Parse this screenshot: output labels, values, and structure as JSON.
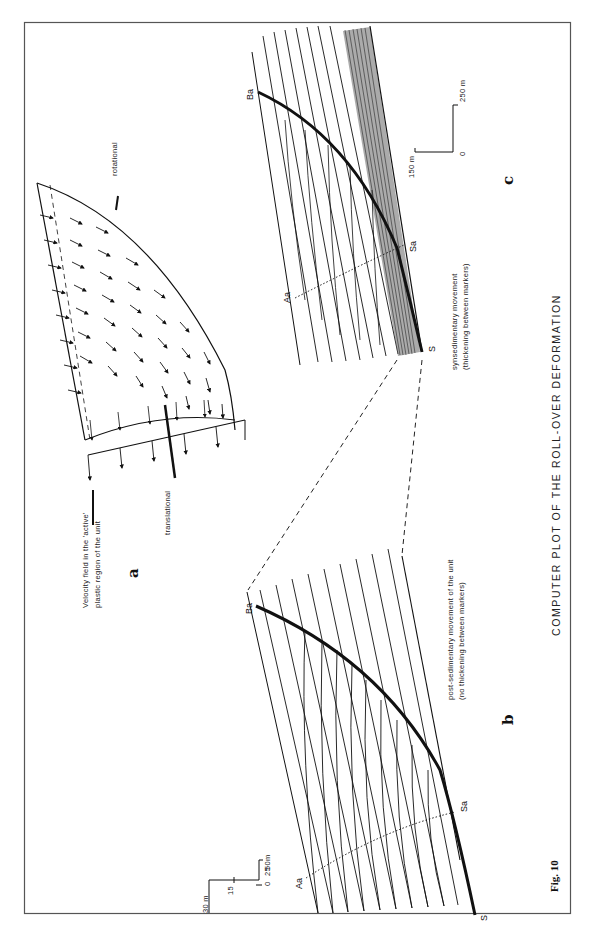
{
  "figure": {
    "number": "Fig. 10",
    "caption": "COMPUTER PLOT OF THE ROLL-OVER DEFORMATION"
  },
  "panels": {
    "a": {
      "label": "a",
      "velocity_label_line1": "Velocity field in the 'active'",
      "velocity_label_line2": "plastic region of the unit",
      "rotational_label": "rotational",
      "translational_label": "translational"
    },
    "b": {
      "label": "b",
      "description_line1": "post-sedimentary movement of the unit",
      "description_line2": "(no thickening between markers)",
      "points": {
        "Ba": "Ba",
        "Aa": "Aa",
        "Sa": "Sa",
        "S": "S"
      },
      "scale": {
        "v_max": "30 m",
        "v_mid": "15",
        "zero": "0",
        "h_mid": "25",
        "h_max": "50m"
      }
    },
    "c": {
      "label": "c",
      "description_line1": "synsedimentary movement",
      "description_line2": "(thickening between markers)",
      "points": {
        "Ba": "Ba",
        "Aa": "Aa",
        "Sa": "Sa",
        "S": "S"
      },
      "scale": {
        "v_max": "150 m",
        "zero": "0",
        "h_max": "250 m"
      }
    }
  }
}
